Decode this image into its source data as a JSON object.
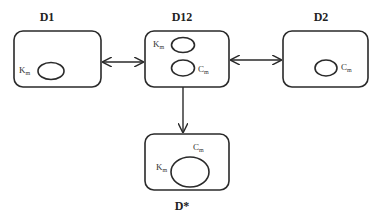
{
  "diagram": {
    "nodes": [
      {
        "id": "D1",
        "title": "D1",
        "circles": [
          {
            "label": "K",
            "sub": "m"
          }
        ]
      },
      {
        "id": "D12",
        "title": "D12",
        "circles": [
          {
            "label": "K",
            "sub": "m"
          },
          {
            "label": "C",
            "sub": "m"
          }
        ]
      },
      {
        "id": "D2",
        "title": "D2",
        "circles": [
          {
            "label": "C",
            "sub": "m"
          }
        ]
      },
      {
        "id": "Dstar",
        "title": "D*",
        "circles": [
          {
            "label_left": "K",
            "sub_left": "m",
            "label_top": "C",
            "sub_top": "m"
          }
        ]
      }
    ],
    "edges": [
      {
        "from": "D1",
        "to": "D12",
        "direction": "bidirectional"
      },
      {
        "from": "D12",
        "to": "D2",
        "direction": "bidirectional"
      },
      {
        "from": "D12",
        "to": "Dstar",
        "direction": "forward"
      }
    ]
  }
}
